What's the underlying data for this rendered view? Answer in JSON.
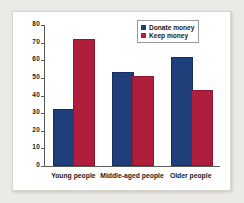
{
  "chart_data": {
    "type": "bar",
    "title": "",
    "xlabel": "",
    "ylabel": "",
    "ylim": [
      0,
      80
    ],
    "yticks": [
      0,
      10,
      20,
      30,
      40,
      50,
      60,
      70,
      80
    ],
    "ytick_labels": [
      "0",
      "10",
      "20",
      "30",
      "40",
      "50",
      "60",
      "70",
      "80"
    ],
    "grid": false,
    "legend_position": "top-right",
    "categories": [
      "Young people",
      "Middle-aged people",
      "Older people"
    ],
    "series": [
      {
        "name": "Donate money",
        "color": "#1f3f7a",
        "values": [
          31,
          52,
          61
        ]
      },
      {
        "name": "Keep money",
        "color": "#af1e3c",
        "values": [
          71,
          50,
          42
        ]
      }
    ]
  }
}
